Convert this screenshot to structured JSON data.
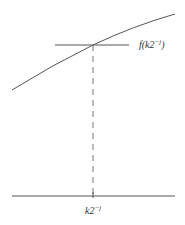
{
  "diagram": {
    "type": "function-sample-point",
    "curve": {
      "description": "increasing concave curve f(x)",
      "color": "#555555"
    },
    "tangent_line": {
      "description": "horizontal line at f(k2^-j)",
      "color": "#555555"
    },
    "dashed_projection": {
      "description": "dashed vertical line from curve point to x-axis",
      "color": "#777777"
    },
    "axis": {
      "description": "horizontal x-axis",
      "color": "#555555"
    },
    "labels": {
      "value_label": {
        "base": "f(k2",
        "sup": "−j",
        "close": ")"
      },
      "point_label": {
        "base": "k2",
        "sup": "−j"
      }
    }
  }
}
